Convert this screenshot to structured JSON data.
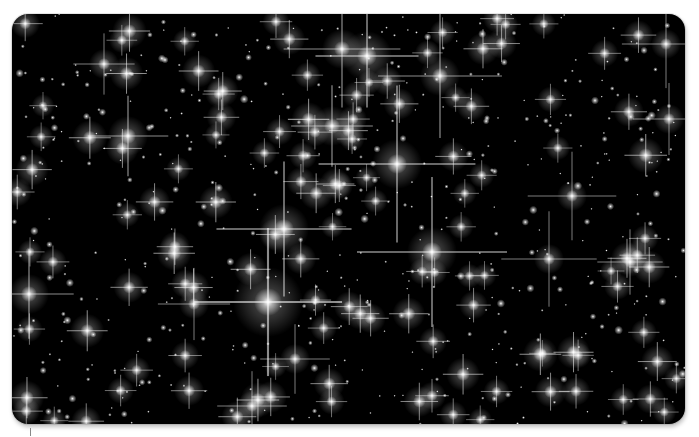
{
  "image": {
    "subject": "star-field",
    "description": "Dense star cluster with diffraction spikes on black background",
    "background_color": "#000000",
    "frame_color": "#ffffff"
  }
}
